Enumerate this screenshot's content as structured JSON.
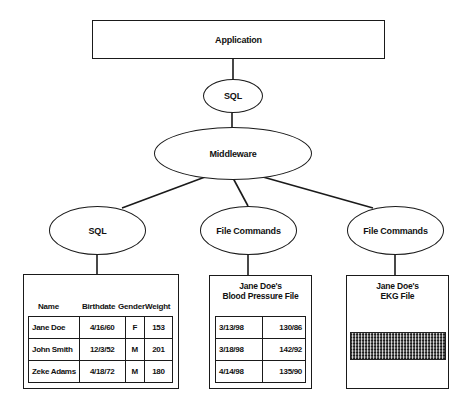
{
  "diagram": {
    "application": {
      "label": "Application"
    },
    "top_protocol": {
      "label": "SQL"
    },
    "middleware": {
      "label": "Middleware"
    },
    "branches": [
      {
        "protocol": "SQL",
        "store": {
          "type": "relational-table",
          "columns": [
            "Name",
            "Birthdate",
            "Gender",
            "Weight"
          ],
          "rows": [
            [
              "Jane Doe",
              "4/16/60",
              "F",
              "153"
            ],
            [
              "John Smith",
              "12/3/52",
              "M",
              "201"
            ],
            [
              "Zeke Adams",
              "4/18/72",
              "M",
              "180"
            ]
          ]
        }
      },
      {
        "protocol": "File Commands",
        "store": {
          "type": "file",
          "title_line1": "Jane Doe's",
          "title_line2": "Blood Pressure File",
          "rows": [
            [
              "3/13/98",
              "130/86"
            ],
            [
              "3/18/98",
              "142/92"
            ],
            [
              "4/14/98",
              "135/90"
            ]
          ]
        }
      },
      {
        "protocol": "File Commands",
        "store": {
          "type": "file",
          "title_line1": "Jane Doe's",
          "title_line2": "EKG File",
          "content": "ekg-trace-image"
        }
      }
    ]
  },
  "colors": {
    "line": "#1a1a1a",
    "background": "#ffffff"
  }
}
